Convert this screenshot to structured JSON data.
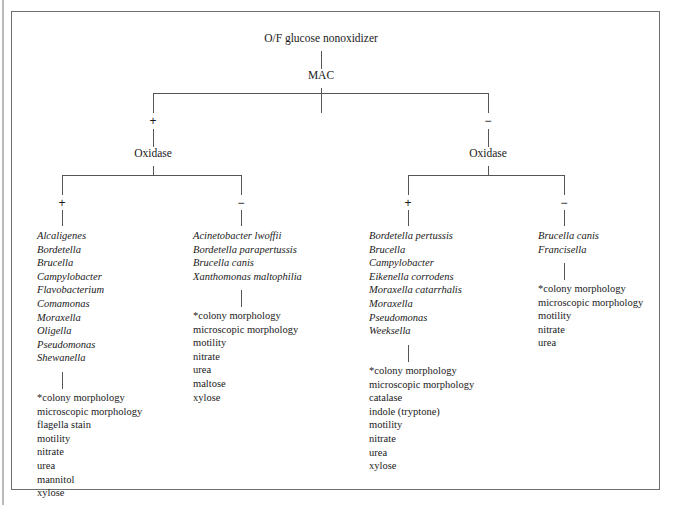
{
  "diagram": {
    "type": "dichotomous-identification-key",
    "root": {
      "label": "O/F glucose nonoxidizer"
    },
    "mac": {
      "label": "MAC"
    },
    "signs": {
      "plus": "+",
      "minus": "−"
    },
    "oxidase_left": {
      "label": "Oxidase"
    },
    "oxidase_right": {
      "label": "Oxidase"
    },
    "branches": [
      {
        "id": "mac-pos-oxidase-pos",
        "sign": "+",
        "organisms": [
          "Alcaligenes",
          "Bordetella",
          "Brucella",
          "Campylobacter",
          "Flavobacterium",
          "Comamonas",
          "Moraxella",
          "Oligella",
          "Pseudomonas",
          "Shewanella"
        ],
        "tests": [
          "*colony morphology",
          "microscopic morphology",
          "flagella stain",
          "motility",
          "nitrate",
          "urea",
          "mannitol",
          "xylose"
        ]
      },
      {
        "id": "mac-pos-oxidase-neg",
        "sign": "−",
        "organisms": [
          "Acinetobacter lwoffii",
          "Bordetella parapertussis",
          "Brucella canis",
          "Xanthomonas maltophilia"
        ],
        "tests": [
          "*colony morphology",
          "microscopic morphology",
          "motility",
          "nitrate",
          "urea",
          "maltose",
          "xylose"
        ]
      },
      {
        "id": "mac-neg-oxidase-pos",
        "sign": "+",
        "organisms": [
          "Bordetella pertussis",
          "Brucella",
          "Campylobacter",
          "Eikenella corrodens",
          "Moraxella catarrhalis",
          "Moraxella",
          "Pseudomonas",
          "Weeksella"
        ],
        "tests": [
          "*colony morphology",
          "microscopic morphology",
          "catalase",
          "indole (tryptone)",
          "motility",
          "nitrate",
          "urea",
          "xylose"
        ]
      },
      {
        "id": "mac-neg-oxidase-neg",
        "sign": "−",
        "organisms": [
          "Brucella canis",
          "Francisella"
        ],
        "tests": [
          "*colony morphology",
          "microscopic morphology",
          "motility",
          "nitrate",
          "urea"
        ]
      }
    ]
  },
  "colors": {
    "line": "#555555",
    "frame": "#6f6f6f",
    "text": "#1a1a1a",
    "background": "#ffffff"
  }
}
